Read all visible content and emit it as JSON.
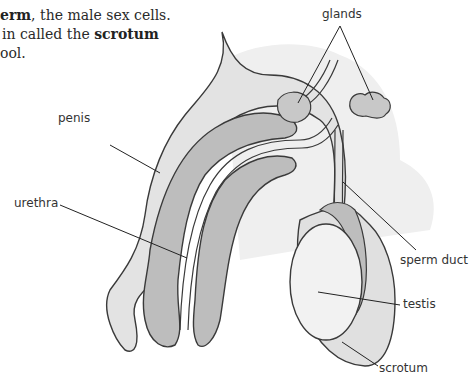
{
  "intro_text": {
    "line1_bold": "erm",
    "line1_rest": ", the male sex cells.",
    "line2_prefix": "in called the ",
    "line2_bold": "scrotum",
    "line3": "ool."
  },
  "labels": {
    "glands": "glands",
    "penis": "penis",
    "urethra": "urethra",
    "sperm_duct": "sperm duct",
    "testis": "testis",
    "scrotum": "scrotum"
  },
  "colors": {
    "outline": "#3a3a3a",
    "light_fill": "#e6e6e6",
    "mid_fill": "#bdbdbd",
    "testis_fill": "#f2f2f2",
    "background": "#ffffff"
  }
}
